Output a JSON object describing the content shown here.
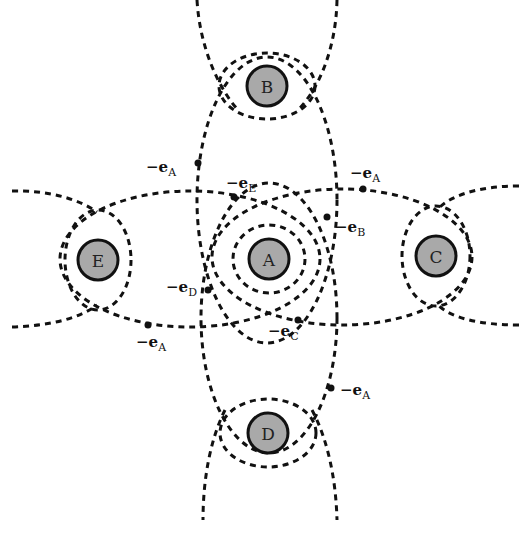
{
  "diagram": {
    "atoms": [
      {
        "id": "A",
        "label": "A",
        "x": 269,
        "y": 259
      },
      {
        "id": "B",
        "label": "B",
        "x": 267,
        "y": 86
      },
      {
        "id": "C",
        "label": "C",
        "x": 436,
        "y": 256
      },
      {
        "id": "D",
        "label": "D",
        "x": 268,
        "y": 433
      },
      {
        "id": "E",
        "label": "E",
        "x": 98,
        "y": 260
      }
    ],
    "labels": [
      {
        "id": "l1",
        "prefix": "−e",
        "sub": "A",
        "x": 146,
        "y": 172
      },
      {
        "id": "l2",
        "prefix": "−e",
        "sub": "E",
        "x": 226,
        "y": 188
      },
      {
        "id": "l3",
        "prefix": "−e",
        "sub": "A",
        "x": 350,
        "y": 178
      },
      {
        "id": "l4",
        "prefix": "−e",
        "sub": "B",
        "x": 335,
        "y": 232
      },
      {
        "id": "l5",
        "prefix": "−e",
        "sub": "D",
        "x": 166,
        "y": 292
      },
      {
        "id": "l6",
        "prefix": "−e",
        "sub": "C",
        "x": 268,
        "y": 336
      },
      {
        "id": "l7",
        "prefix": "−e",
        "sub": "A",
        "x": 136,
        "y": 347
      },
      {
        "id": "l8",
        "prefix": "−e",
        "sub": "A",
        "x": 340,
        "y": 395
      }
    ]
  }
}
